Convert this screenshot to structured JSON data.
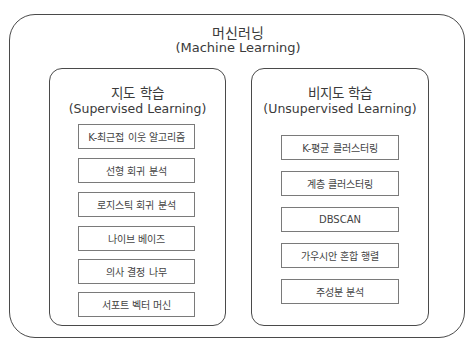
{
  "root": {
    "title_ko": "머신러닝",
    "title_en": "(Machine Learning)"
  },
  "groups": [
    {
      "title_ko": "지도 학습",
      "title_en": "(Supervised Learning)",
      "items": [
        "K-최근접 이웃 알고리즘",
        "선형 회귀 분석",
        "로지스틱 회귀 분석",
        "나이브 베이즈",
        "의사 결정 나무",
        "서포트 벡터 머신"
      ]
    },
    {
      "title_ko": "비지도 학습",
      "title_en": "(Unsupervised Learning)",
      "items": [
        "K-평균 클러스터링",
        "계층 클러스터링",
        "DBSCAN",
        "가우시안 혼합 행렬",
        "주성분 분석"
      ]
    }
  ]
}
